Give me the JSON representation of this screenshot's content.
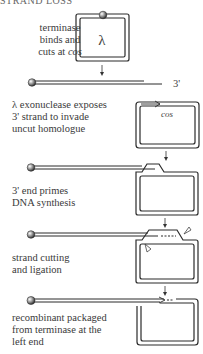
{
  "header": {
    "title": "STRAND LOSS"
  },
  "steps": [
    {
      "id": "step1",
      "label_lines": [
        "terminase",
        "binds and",
        "cuts at "
      ],
      "label_italic": "cos",
      "glyph": "λ"
    },
    {
      "id": "step2",
      "end_label": "3'"
    },
    {
      "id": "step3",
      "label_lines": [
        "λ exonuclease exposes",
        "3' strand to invade",
        "uncut homologue"
      ],
      "box_label": "cos"
    },
    {
      "id": "step4",
      "label_lines": [
        "3' end primes",
        "DNA synthesis"
      ]
    },
    {
      "id": "step5",
      "label_lines": [
        "strand cutting",
        "and ligation"
      ]
    },
    {
      "id": "step6",
      "label_lines": [
        "recombinant packaged",
        "from terminase at the",
        "left end"
      ]
    }
  ],
  "colors": {
    "line": "#2b2b2b",
    "text": "#3a3a3a",
    "bead": "#555555"
  }
}
